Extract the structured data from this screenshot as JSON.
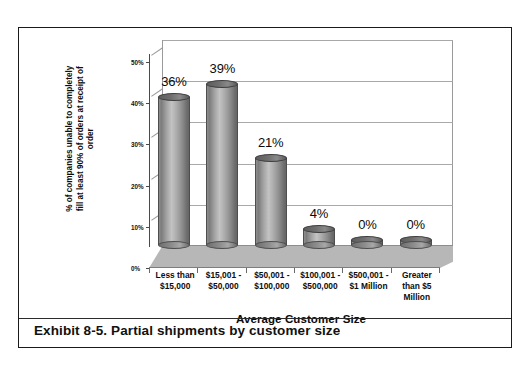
{
  "figure": {
    "caption": "Exhibit 8-5. Partial shipments by customer size"
  },
  "chart_data": {
    "type": "bar",
    "title": "",
    "subtitle": "",
    "xlabel": "Average Customer Size",
    "ylabel": "% of companies unable to completely fill at least 90% of orders at receipt of order",
    "ylabel_lines": [
      "% of companies unable to completely",
      "fill at least 90% of orders at receipt of",
      "order"
    ],
    "categories": [
      "Less than $15,000",
      "$15,001 - $50,000",
      "$50,001 - $100,000",
      "$100,001 - $500,000",
      "$500,001 - $1 Million",
      "Greater than $5 Million"
    ],
    "category_lines": [
      [
        "Less than",
        "$15,000"
      ],
      [
        "$15,001 -",
        "$50,000"
      ],
      [
        "$50,001 -",
        "$100,000"
      ],
      [
        "$100,001 -",
        "$500,000"
      ],
      [
        "$500,001 -",
        "$1 Million"
      ],
      [
        "Greater",
        "than $5",
        "Million"
      ]
    ],
    "values": [
      36,
      39,
      21,
      4,
      0,
      0
    ],
    "data_labels": [
      "36%",
      "39%",
      "21%",
      "4%",
      "0%",
      "0%"
    ],
    "ylim": [
      0,
      50
    ],
    "yticks": [
      0,
      10,
      20,
      30,
      40,
      50
    ],
    "ytick_labels": [
      "0%",
      "10%",
      "20%",
      "30%",
      "40%",
      "50%"
    ],
    "grid": true,
    "grid_axis": "y",
    "legend": false,
    "legend_position": "none",
    "style": "3d-cylinder",
    "bar_color": "#8e8e8e",
    "floor_color": "#b7b7b7",
    "gridline_color": "#a8a8a8",
    "text_color": "#0d0d0d"
  }
}
